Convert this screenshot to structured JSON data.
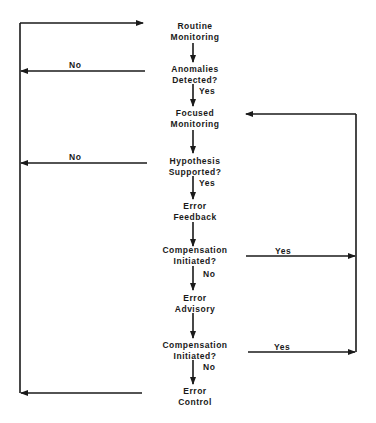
{
  "diagram": {
    "type": "flowchart",
    "nodes": [
      {
        "id": "routine",
        "line1": "Routine",
        "line2": "Monitoring"
      },
      {
        "id": "anomalies",
        "line1": "Anomalies",
        "line2": "Detected?"
      },
      {
        "id": "focused",
        "line1": "Focused",
        "line2": "Monitoring"
      },
      {
        "id": "hypothesis",
        "line1": "Hypothesis",
        "line2": "Supported?"
      },
      {
        "id": "feedback",
        "line1": "Error",
        "line2": "Feedback"
      },
      {
        "id": "comp1",
        "line1": "Compensation",
        "line2": "Initiated?"
      },
      {
        "id": "advisory",
        "line1": "Error",
        "line2": "Advisory"
      },
      {
        "id": "comp2",
        "line1": "Compensation",
        "line2": "Initiated?"
      },
      {
        "id": "control",
        "line1": "Error",
        "line2": "Control"
      }
    ],
    "edge_labels": {
      "anomalies_no": "No",
      "anomalies_yes": "Yes",
      "hypothesis_no": "No",
      "hypothesis_yes": "Yes",
      "comp1_yes": "Yes",
      "comp1_no": "No",
      "comp2_yes": "Yes",
      "comp2_no": "No"
    },
    "colors": {
      "line": "#1a1a1a",
      "background": "#ffffff"
    }
  }
}
